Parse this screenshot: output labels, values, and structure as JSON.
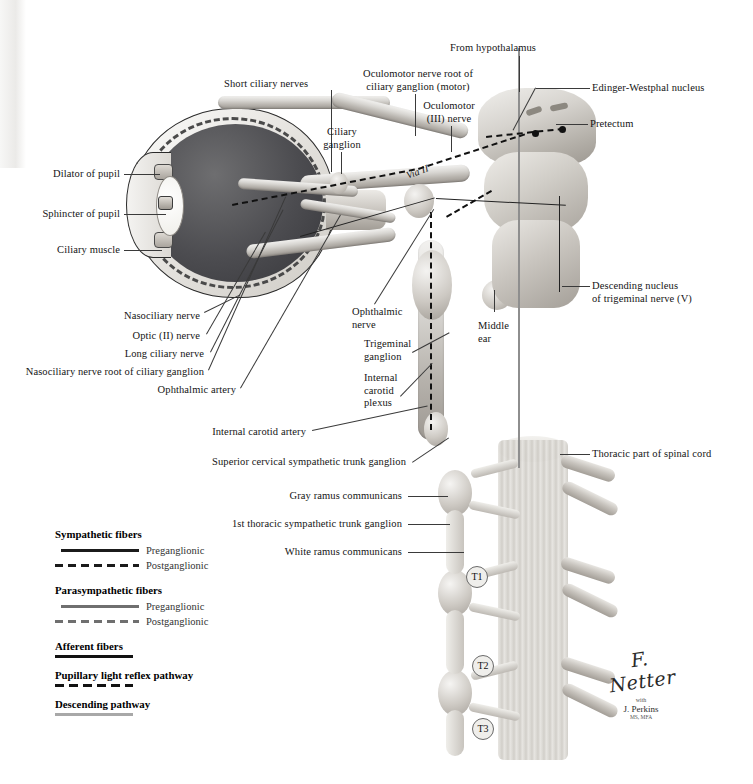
{
  "figure": {
    "signature": {
      "artist": "F. Netter",
      "credential": "M.D.",
      "with": "with",
      "collaborator": "J. Perkins",
      "collaborator_degrees": "MS, MFA"
    }
  },
  "labels": {
    "from_hypothalamus": "From hypothalamus",
    "edinger_westphal": "Edinger-Westphal nucleus",
    "pretectum": "Pretectum",
    "oculomotor_root": "Oculomotor nerve root of\nciliary ganglion (motor)",
    "oculomotor_nerve": "Oculomotor\n(III) nerve",
    "short_ciliary_nerves": "Short ciliary nerves",
    "ciliary_ganglion": "Ciliary\nganglion",
    "via_ii": "Via II",
    "dilator_of_pupil": "Dilator of pupil",
    "sphincter_of_pupil": "Sphincter of pupil",
    "ciliary_muscle": "Ciliary muscle",
    "nasociliary_nerve": "Nasociliary nerve",
    "optic_nerve": "Optic (II) nerve",
    "long_ciliary_nerve": "Long ciliary nerve",
    "nasociliary_root": "Nasociliary nerve root of ciliary ganglion",
    "ophthalmic_artery": "Ophthalmic artery",
    "ophthalmic_nerve": "Ophthalmic\nnerve",
    "trigeminal_ganglion": "Trigeminal\nganglion",
    "internal_carotid_plexus": "Internal\ncarotid\nplexus",
    "middle_ear": "Middle\near",
    "descending_nucleus": "Descending nucleus\nof trigeminal nerve (V)",
    "internal_carotid_artery": "Internal carotid artery",
    "superior_cervical_ganglion": "Superior cervical sympathetic trunk ganglion",
    "thoracic_spinal_cord": "Thoracic part of spinal cord",
    "gray_ramus": "Gray ramus communicans",
    "first_thoracic_ganglion": "1st thoracic sympathetic trunk ganglion",
    "white_ramus": "White ramus communicans",
    "t1": "T1",
    "t2": "T2",
    "t3": "T3"
  },
  "legend": {
    "groups": [
      {
        "heading": "Sympathetic fibers",
        "entries": [
          {
            "label": "Preganglionic",
            "style": "solid",
            "color": "#1b1b1b"
          },
          {
            "label": "Postganglionic",
            "style": "dashed",
            "color": "#1b1b1b"
          }
        ]
      },
      {
        "heading": "Parasympathetic fibers",
        "entries": [
          {
            "label": "Preganglionic",
            "style": "solid",
            "color": "#6f6f6f"
          },
          {
            "label": "Postganglionic",
            "style": "dashed",
            "color": "#6f6f6f"
          }
        ]
      },
      {
        "heading": "Afferent fibers",
        "entries": [
          {
            "label": "",
            "style": "solid",
            "color": "#121212"
          }
        ]
      },
      {
        "heading": "Pupillary light reflex pathway",
        "entries": [
          {
            "label": "",
            "style": "dashed",
            "color": "#121212"
          }
        ]
      },
      {
        "heading": "Descending pathway",
        "entries": [
          {
            "label": "",
            "style": "solid",
            "color": "#a8a8a8"
          }
        ]
      }
    ]
  },
  "colors": {
    "background": "#ffffff",
    "text": "#141414",
    "leader": "#3a3a3a",
    "tissue_light": "#efedea",
    "tissue_mid": "#c9c5bf",
    "tissue_dark": "#9d9892",
    "sympathetic": "#1b1b1b",
    "parasympathetic": "#6f6f6f",
    "descending": "#a8a8a8"
  }
}
